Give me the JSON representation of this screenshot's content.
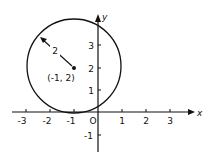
{
  "figure": {
    "type": "circle-on-coordinate-plane",
    "x_axis": {
      "label": "x",
      "ticks": [
        {
          "value": -3,
          "label": "-3"
        },
        {
          "value": -2,
          "label": "-2"
        },
        {
          "value": -1,
          "label": "-1"
        },
        {
          "value": 0,
          "label": "O"
        },
        {
          "value": 1,
          "label": "1"
        },
        {
          "value": 2,
          "label": "2"
        },
        {
          "value": 3,
          "label": "3"
        }
      ]
    },
    "y_axis": {
      "label": "y",
      "ticks": [
        {
          "value": -1,
          "label": "-1"
        },
        {
          "value": 1,
          "label": "1"
        },
        {
          "value": 2,
          "label": "2"
        },
        {
          "value": 3,
          "label": "3"
        }
      ]
    },
    "circle": {
      "center": [
        -1,
        2
      ],
      "center_label": "(-1, 2)",
      "radius": 2,
      "radius_label": "2"
    },
    "colors": {
      "ink": "#111111",
      "background": "#ffffff"
    }
  }
}
